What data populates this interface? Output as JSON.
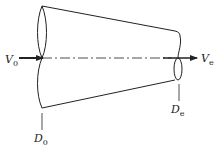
{
  "diagram": {
    "labels": {
      "inlet_velocity": {
        "main": "V",
        "sub": "0"
      },
      "exit_velocity": {
        "main": "V",
        "sub": "e"
      },
      "inlet_diameter": {
        "main": "D",
        "sub": "0"
      },
      "exit_diameter": {
        "main": "D",
        "sub": "e"
      }
    },
    "colors": {
      "stroke": "#222222",
      "background": "#ffffff"
    }
  }
}
